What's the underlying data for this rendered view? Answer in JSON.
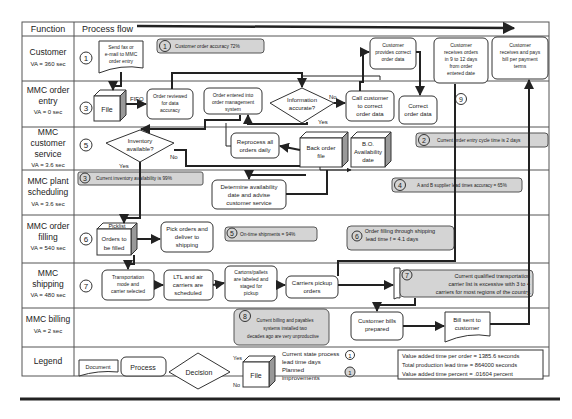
{
  "header": {
    "function_label": "Function",
    "process_flow_label": "Process flow"
  },
  "lanes": [
    {
      "name": "Customer",
      "va": "VA = 360 sec",
      "step": "1"
    },
    {
      "name_lines": [
        "MMC order",
        "entry"
      ],
      "va": "VA = 0 sec",
      "step": "3"
    },
    {
      "name_lines": [
        "MMC",
        "customer",
        "service"
      ],
      "va": "VA = 3.6 sec",
      "step": "5"
    },
    {
      "name_lines": [
        "MMC plant",
        "scheduling"
      ],
      "va": "VA = 3.6 sec",
      "step": ""
    },
    {
      "name_lines": [
        "MMC order",
        "filling"
      ],
      "va": "VA = 540 sec",
      "step": "6"
    },
    {
      "name_lines": [
        "MMC",
        "shipping"
      ],
      "va": "VA = 480 sec",
      "step": "7"
    },
    {
      "name": "MMC billing",
      "va": "VA = 2 sec",
      "step": ""
    },
    {
      "name": "Legend",
      "va": "",
      "step": ""
    }
  ],
  "nodes": {
    "send_fax": [
      "Send fax or",
      "e-mail to MMC",
      "order entry"
    ],
    "file": "File",
    "fifo": "FIFO",
    "order_reviewed": [
      "Order reviewed",
      "for data",
      "accuracy"
    ],
    "order_entered": [
      "Order entered into",
      "order management",
      "system"
    ],
    "information_accurate": [
      "Information",
      "accurate?"
    ],
    "no": "No",
    "yes": "Yes",
    "call_customer": [
      "Call customer",
      "to correct",
      "order data"
    ],
    "customer_provides": [
      "Customer",
      "provides correct",
      "order data"
    ],
    "correct_order_data": [
      "Correct",
      "order data"
    ],
    "customer_receives_orders": [
      "Customer",
      "receives orders",
      "in 9 to 12 days",
      "from order",
      "entered date"
    ],
    "customer_pays": [
      "Customer",
      "receives and pays",
      "bill per payment",
      "terms"
    ],
    "inventory_available": [
      "Inventory",
      "available?"
    ],
    "reprocess": [
      "Reprocess all",
      "orders daily"
    ],
    "back_order_file": [
      "Back order",
      "file"
    ],
    "bo_availability": [
      "B.O.",
      "Availability",
      "date"
    ],
    "determine_availability": [
      "Determine availability",
      "date and advise",
      "customer service"
    ],
    "picklist": "Picklist",
    "orders_to_be_filled": [
      "Orders to",
      "be filled"
    ],
    "pick_orders": [
      "Pick orders and",
      "deliver to",
      "shipping"
    ],
    "transport_mode": [
      "Transportation",
      "mode and",
      "carrier selected"
    ],
    "ltl_air": [
      "LTL and air",
      "carriers are",
      "scheduled"
    ],
    "cartons": [
      "Cartons/pallets",
      "are labeled and",
      "staged for",
      "pickup"
    ],
    "carriers_pickup": [
      "Carriers pickup",
      "orders"
    ],
    "customer_bills": [
      "Customer bills",
      "prepared"
    ],
    "bill_sent": [
      "Bill sent to",
      "customer"
    ]
  },
  "notes": {
    "n1": {
      "num": "1",
      "text": "Customer order accuracy 72%"
    },
    "n2": {
      "num": "2",
      "text": "Current order entry cycle time is 2 days"
    },
    "n3": {
      "num": "3",
      "text": "Current inventory availability is 99%"
    },
    "n4": {
      "num": "4",
      "text": "A and B supplier lead times accuracy = 65%"
    },
    "n5": {
      "num": "5",
      "text": "On-time shipments = 94%"
    },
    "n6": {
      "num": "6",
      "lines": [
        "Order filling through shipping",
        "lead time f = 4.1 days"
      ]
    },
    "n7": {
      "num": "7",
      "lines": [
        "Current qualified  transportation",
        "carrier list is excessive with 3 to 4",
        "carriers for most regions of the country."
      ]
    },
    "n8": {
      "num": "8",
      "lines": [
        "Current billing and payables",
        "systems installed two",
        "decades ago are very unproductive"
      ]
    },
    "n9": {
      "num": "9"
    }
  },
  "legend": {
    "document": "Document",
    "process": "Process",
    "decision": "Decision",
    "yes": "Yes",
    "no": "No",
    "file": "File",
    "current_state_lines": [
      "Current state process",
      "lead time days"
    ],
    "planned_lines": [
      "Planned",
      "improvements"
    ],
    "circle_num": "1",
    "summary": [
      "Value added time per order = 1385.6 seconds",
      "Total production lead time =  864000 seconds",
      "Value added time percent =  .01604 percent"
    ]
  }
}
